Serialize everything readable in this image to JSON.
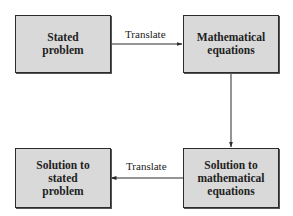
{
  "diagram": {
    "type": "flowchart",
    "nodes": [
      {
        "id": "stated_problem",
        "label": "Stated\nproblem"
      },
      {
        "id": "math_equations",
        "label": "Mathematical\nequations"
      },
      {
        "id": "solution_math",
        "label": "Solution to\nmathematical\nequations"
      },
      {
        "id": "solution_stated",
        "label": "Solution to\nstated\nproblem"
      }
    ],
    "edges": [
      {
        "from": "stated_problem",
        "to": "math_equations",
        "label": "Translate"
      },
      {
        "from": "math_equations",
        "to": "solution_math",
        "label": ""
      },
      {
        "from": "solution_math",
        "to": "solution_stated",
        "label": "Translate"
      }
    ],
    "colors": {
      "box_fill": "#d9d9d9",
      "box_border": "#2b2b2b",
      "line": "#2b2b2b",
      "background": "#ffffff"
    }
  }
}
